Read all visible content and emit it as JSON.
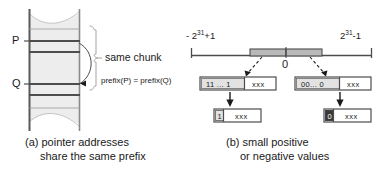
{
  "figure": {
    "panels": [
      {
        "id": "a",
        "caption_line1": "(a) pointer addresses",
        "caption_line2": "share the same prefix",
        "pointer_labels": [
          "P",
          "Q"
        ],
        "brace_label": "same chunk",
        "prefix_equation": "prefix(P) = prefix(Q)"
      },
      {
        "id": "b",
        "caption_line1": "(b) small positive",
        "caption_line2": "or negative values",
        "axis": {
          "left_bound_prefix": "- 2",
          "left_bound_exp": "31",
          "left_bound_suffix": "+1",
          "right_bound_prefix": "2",
          "right_bound_exp": "31",
          "right_bound_suffix": "-1",
          "center_label": "0"
        },
        "boxes": {
          "negative_wide": {
            "bits": "11 ... 1",
            "payload": "xxx"
          },
          "positive_wide": {
            "bits": "00... 0",
            "payload": "xxx"
          },
          "negative_small": {
            "bit": "1",
            "payload": "xxx"
          },
          "positive_small": {
            "bit": "0",
            "payload": "xxx"
          }
        }
      }
    ]
  },
  "colors": {
    "stroke": "#4d4d4d",
    "fill_light": "#e8e8e8",
    "fill_mid": "#c9c9c9",
    "fill_dark": "#3a3a3a",
    "text": "#1a1a1a",
    "background": "#ffffff"
  }
}
